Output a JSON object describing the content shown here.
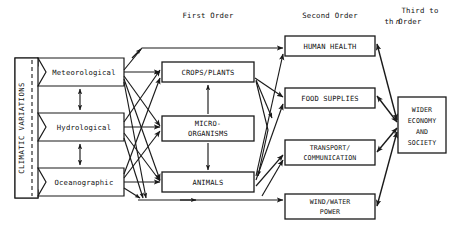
{
  "diagram": {
    "headers": [
      {
        "id": "first-order",
        "label": "First Order",
        "x": 208,
        "y": 16
      },
      {
        "id": "second-order",
        "label": "Second Order",
        "x": 330,
        "y": 16
      },
      {
        "id": "third-order-line1",
        "label": "Third to",
        "x": 420,
        "y": 12
      },
      {
        "id": "third-order-line2-prefix",
        "label": "n",
        "x": 405,
        "y": 23
      },
      {
        "id": "third-order-line2-suffix",
        "label": "th Order",
        "x": 424,
        "y": 23
      }
    ],
    "bracket": {
      "label": "CLIMATIC VARIATIONS",
      "orientation": "vertical"
    },
    "sources": [
      {
        "id": "meteorological",
        "label": "Meteorological"
      },
      {
        "id": "hydrological",
        "label": "Hydrological"
      },
      {
        "id": "oceanographic",
        "label": "Oceanographic"
      }
    ],
    "first_order": [
      {
        "id": "crops-plants",
        "lines": [
          "CROPS/PLANTS"
        ]
      },
      {
        "id": "micro-organisms",
        "lines": [
          "MICRO-",
          "ORGANISMS"
        ]
      },
      {
        "id": "animals",
        "lines": [
          "ANIMALS"
        ]
      }
    ],
    "second_order": [
      {
        "id": "human-health",
        "lines": [
          "HUMAN HEALTH"
        ]
      },
      {
        "id": "food-supplies",
        "lines": [
          "FOOD SUPPLIES"
        ]
      },
      {
        "id": "transport-communication",
        "lines": [
          "TRANSPORT/",
          "COMMUNICATION"
        ]
      },
      {
        "id": "wind-water-power",
        "lines": [
          "WIND/WATER",
          "POWER"
        ]
      }
    ],
    "third_order": [
      {
        "id": "wider-economy-society",
        "lines": [
          "WIDER",
          "ECONOMY",
          "AND",
          "SOCIETY"
        ]
      }
    ],
    "colors": {
      "stroke": "#1a1a1a",
      "fill": "#ffffff",
      "text": "#111111"
    }
  }
}
